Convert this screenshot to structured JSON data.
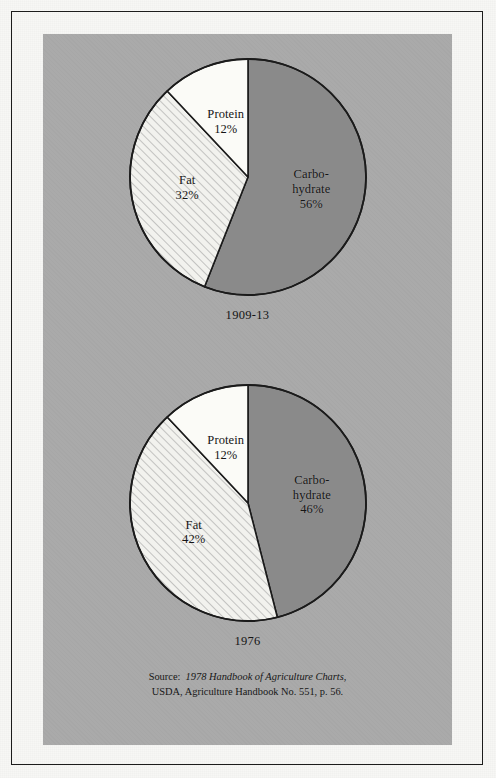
{
  "figure": {
    "source_note": {
      "line1_prefix": "Source:  ",
      "line1_italic": "1978 Handbook of Agriculture Charts",
      "line1_suffix": ",",
      "line2": "USDA, Agriculture Handbook No. 551, p. 56."
    }
  },
  "colors": {
    "page": "#f7f7f5",
    "panel_gray": "#a9a9a9",
    "border": "#1c1c1c",
    "carbohydrate": "#8a8a8a",
    "fat": "#f2f2ee",
    "fat_hatch": "#9a9a9a",
    "protein": "#fbfbf7",
    "slice_outline": "#1b1b1b",
    "text": "#151515"
  },
  "chart_data": [
    {
      "type": "pie",
      "title": "1909-13",
      "subtitle": "",
      "categories": [
        "Carbohydrate",
        "Fat",
        "Protein"
      ],
      "values": [
        56,
        32,
        12
      ],
      "unit": "%",
      "start_angle_deg": 0,
      "direction": "clockwise",
      "legend": "none",
      "grid": false,
      "labels": [
        {
          "name": "Carbohydrate",
          "text": "Carbo-\nhydrate\n56%",
          "value": 56,
          "fill": "carbohydrate"
        },
        {
          "name": "Fat",
          "text": "Fat\n32%",
          "value": 32,
          "fill": "fat"
        },
        {
          "name": "Protein",
          "text": "Protein\n12%",
          "value": 12,
          "fill": "protein"
        }
      ]
    },
    {
      "type": "pie",
      "title": "1976",
      "subtitle": "",
      "categories": [
        "Carbohydrate",
        "Fat",
        "Protein"
      ],
      "values": [
        46,
        42,
        12
      ],
      "unit": "%",
      "start_angle_deg": 0,
      "direction": "clockwise",
      "legend": "none",
      "grid": false,
      "labels": [
        {
          "name": "Carbohydrate",
          "text": "Carbo-\nhydrate\n46%",
          "value": 46,
          "fill": "carbohydrate"
        },
        {
          "name": "Fat",
          "text": "Fat\n42%",
          "value": 42,
          "fill": "fat"
        },
        {
          "name": "Protein",
          "text": "Protein\n12%",
          "value": 12,
          "fill": "protein"
        }
      ]
    }
  ]
}
